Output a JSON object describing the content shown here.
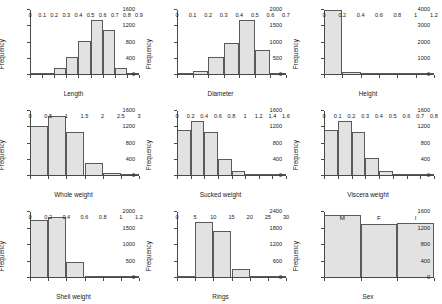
{
  "figure": {
    "ylabel": "Frequency",
    "bar_fill": "#e2e2e2",
    "bar_edge": "#5a5a5a",
    "axis_color": "#4a4a4a"
  },
  "chart_data": [
    {
      "type": "bar",
      "title": "",
      "xlabel": "Length",
      "ylabel": "Frequency",
      "grid": false,
      "legend": "none",
      "xlim": [
        0,
        0.9
      ],
      "ylim": [
        0,
        1600
      ],
      "xticks": [
        "0",
        "0.1",
        "0.2",
        "0.3",
        "0.4",
        "0.5",
        "0.6",
        "0.7",
        "0.8",
        "0.9"
      ],
      "yticks": [
        "0",
        "400",
        "800",
        "1200",
        "1600"
      ],
      "bin_edges": [
        0,
        0.1,
        0.2,
        0.3,
        0.4,
        0.5,
        0.6,
        0.7,
        0.8,
        0.9
      ],
      "categories": [
        "0-0.1",
        "0.1-0.2",
        "0.2-0.3",
        "0.3-0.4",
        "0.4-0.5",
        "0.5-0.6",
        "0.6-0.7",
        "0.7-0.8",
        "0.8-0.9"
      ],
      "values": [
        8,
        40,
        175,
        435,
        830,
        1350,
        1110,
        180,
        12
      ]
    },
    {
      "type": "bar",
      "title": "",
      "xlabel": "Diameter",
      "ylabel": "Frequency",
      "grid": false,
      "legend": "none",
      "xlim": [
        0,
        0.7
      ],
      "ylim": [
        0,
        2000
      ],
      "xticks": [
        "0",
        "0.1",
        "0.2",
        "0.3",
        "0.4",
        "0.5",
        "0.6",
        "0.7"
      ],
      "yticks": [
        "0",
        "500",
        "1000",
        "1500",
        "2000"
      ],
      "bin_edges": [
        0,
        0.1,
        0.2,
        0.3,
        0.4,
        0.5,
        0.6,
        0.7
      ],
      "categories": [
        "0-0.1",
        "0.1-0.2",
        "0.2-0.3",
        "0.3-0.4",
        "0.4-0.5",
        "0.5-0.6",
        "0.6-0.7"
      ],
      "values": [
        20,
        120,
        545,
        1000,
        1700,
        755,
        20
      ]
    },
    {
      "type": "bar",
      "title": "",
      "xlabel": "Height",
      "ylabel": "Frequency",
      "grid": false,
      "legend": "none",
      "xlim": [
        0,
        1.2
      ],
      "ylim": [
        0,
        4000
      ],
      "xticks": [
        "0",
        "0.2",
        "0.4",
        "0.6",
        "0.8",
        "1",
        "1.2"
      ],
      "yticks": [
        "0",
        "1000",
        "2000",
        "3000",
        "4000"
      ],
      "bin_edges": [
        0,
        0.2,
        0.4,
        0.6,
        0.8,
        1.0,
        1.2
      ],
      "categories": [
        "0-0.2",
        "0.2-0.4",
        "0.4-0.6",
        "0.6-0.8",
        "0.8-1",
        "1-1.2"
      ],
      "values": [
        3990,
        170,
        8,
        0,
        0,
        8
      ]
    },
    {
      "type": "bar",
      "title": "",
      "xlabel": "Whole weight",
      "ylabel": "Frequency",
      "grid": false,
      "legend": "none",
      "xlim": [
        0,
        3
      ],
      "ylim": [
        0,
        1600
      ],
      "xticks": [
        "0",
        "0.5",
        "1",
        "1.5",
        "2",
        "2.5",
        "3"
      ],
      "yticks": [
        "0",
        "400",
        "800",
        "1200",
        "1600"
      ],
      "bin_edges": [
        0,
        0.5,
        1.0,
        1.5,
        2.0,
        2.5,
        3.0
      ],
      "categories": [
        "0-0.5",
        "0.5-1",
        "1-1.5",
        "1.5-2",
        "2-2.5",
        "2.5-3"
      ],
      "values": [
        1235,
        1470,
        1080,
        310,
        65,
        12
      ]
    },
    {
      "type": "bar",
      "title": "",
      "xlabel": "Sucked weight",
      "ylabel": "Frequency",
      "grid": false,
      "legend": "none",
      "xlim": [
        0,
        1.6
      ],
      "ylim": [
        0,
        1600
      ],
      "xticks": [
        "0",
        "0.2",
        "0.4",
        "0.6",
        "0.8",
        "1",
        "1.2",
        "1.4",
        "1.6"
      ],
      "yticks": [
        "0",
        "400",
        "800",
        "1200",
        "1600"
      ],
      "bin_edges": [
        0,
        0.2,
        0.4,
        0.6,
        0.8,
        1.0,
        1.2,
        1.4,
        1.6
      ],
      "categories": [
        "0-0.2",
        "0.2-0.4",
        "0.4-0.6",
        "0.6-0.8",
        "0.8-1",
        "1-1.2",
        "1.2-1.4",
        "1.4-1.6"
      ],
      "values": [
        1135,
        1360,
        1090,
        430,
        115,
        30,
        10,
        5
      ]
    },
    {
      "type": "bar",
      "title": "",
      "xlabel": "Viscera weight",
      "ylabel": "Frequency",
      "grid": false,
      "legend": "none",
      "xlim": [
        0,
        0.8
      ],
      "ylim": [
        0,
        1600
      ],
      "xticks": [
        "0",
        "0.1",
        "0.2",
        "0.3",
        "0.4",
        "0.5",
        "0.6",
        "0.7",
        "0.8"
      ],
      "yticks": [
        "0",
        "400",
        "800",
        "1200",
        "1600"
      ],
      "bin_edges": [
        0,
        0.1,
        0.2,
        0.3,
        0.4,
        0.5,
        0.6,
        0.7,
        0.8
      ],
      "categories": [
        "0-0.1",
        "0.1-0.2",
        "0.2-0.3",
        "0.3-0.4",
        "0.4-0.5",
        "0.5-0.6",
        "0.6-0.7",
        "0.7-0.8"
      ],
      "values": [
        1130,
        1360,
        1085,
        440,
        135,
        25,
        5,
        3
      ]
    },
    {
      "type": "bar",
      "title": "",
      "xlabel": "Shell weight",
      "ylabel": "Frequency",
      "grid": false,
      "legend": "none",
      "xlim": [
        0,
        1.2
      ],
      "ylim": [
        0,
        2000
      ],
      "xticks": [
        "0",
        "0.2",
        "0.4",
        "0.6",
        "0.8",
        "1",
        "1.2"
      ],
      "yticks": [
        "0",
        "500",
        "1000",
        "1500",
        "2000"
      ],
      "bin_edges": [
        0,
        0.2,
        0.4,
        0.6,
        0.8,
        1.0,
        1.2
      ],
      "categories": [
        "0-0.2",
        "0.2-0.4",
        "0.4-0.6",
        "0.6-0.8",
        "0.8-1",
        "1-1.2"
      ],
      "values": [
        1760,
        1850,
        480,
        75,
        10,
        3
      ]
    },
    {
      "type": "bar",
      "title": "",
      "xlabel": "Rings",
      "ylabel": "Frequency",
      "grid": false,
      "legend": "none",
      "xlim": [
        0,
        30
      ],
      "ylim": [
        0,
        2400
      ],
      "xticks": [
        "0",
        "5",
        "10",
        "15",
        "20",
        "25",
        "30"
      ],
      "yticks": [
        "0",
        "600",
        "1200",
        "1800",
        "2400"
      ],
      "bin_edges": [
        0,
        5,
        10,
        15,
        20,
        25,
        30
      ],
      "categories": [
        "0-5",
        "5-10",
        "10-15",
        "15-20",
        "20-25",
        "25-30"
      ],
      "values": [
        60,
        2020,
        1720,
        310,
        55,
        8
      ]
    },
    {
      "type": "bar",
      "title": "",
      "xlabel": "Sex",
      "ylabel": "Frequency",
      "grid": false,
      "legend": "none",
      "ylim": [
        0,
        1600
      ],
      "yticks": [
        "0",
        "400",
        "800",
        "1200",
        "1600"
      ],
      "categories": [
        "M",
        "F",
        "I"
      ],
      "values": [
        1528,
        1307,
        1342
      ]
    }
  ]
}
